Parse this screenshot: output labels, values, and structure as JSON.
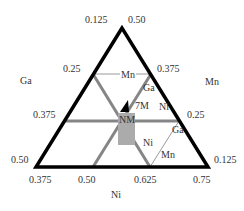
{
  "diagram": {
    "type": "ternary",
    "corner_labels": {
      "left": "Ga",
      "right": "Mn",
      "bottom": "Ni"
    },
    "left_axis_ticks": [
      "0.125",
      "0.25",
      "0.375",
      "0.50"
    ],
    "right_axis_ticks": [
      "0.50",
      "0.375",
      "0.25",
      "0.125"
    ],
    "bottom_axis_ticks": [
      "0.375",
      "0.50",
      "0.625",
      "0.75"
    ],
    "region_labels": {
      "nm": "NM",
      "seven_m": "7M"
    },
    "line_labels": {
      "top_mn": "Mn",
      "top_ga": "Ga",
      "mid_ni": "Ni",
      "lower_ni": "Ni",
      "right_ga": "Ga",
      "right_mn": "Mn"
    },
    "colors": {
      "frame": "#000000",
      "thick_lines": "#808080",
      "thin_lines": "#999999",
      "nm_region": "#aaaaaa",
      "seven_m_region": "#000000"
    }
  }
}
